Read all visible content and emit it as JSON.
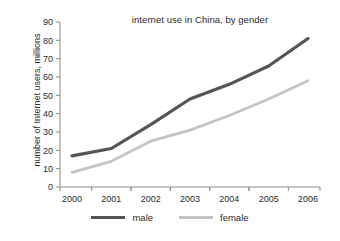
{
  "chart_data": {
    "type": "line",
    "title": "internet use in China, by gender",
    "xlabel": "",
    "ylabel": "number of  Internet users, millions",
    "categories": [
      "2000",
      "2001",
      "2002",
      "2003",
      "2004",
      "2005",
      "2006"
    ],
    "x": [
      2000,
      2001,
      2002,
      2003,
      2004,
      2005,
      2006
    ],
    "series": [
      {
        "name": "male",
        "color": "#555555",
        "values": [
          17,
          21,
          34,
          48,
          56,
          66,
          81
        ]
      },
      {
        "name": "female",
        "color": "#c4c4c4",
        "values": [
          8,
          14,
          25,
          31,
          39,
          48,
          58
        ]
      }
    ],
    "ylim": [
      0,
      90
    ],
    "yticks": [
      0,
      10,
      20,
      30,
      40,
      50,
      60,
      70,
      80,
      90
    ],
    "ytick_labels": [
      "0",
      "10",
      "20",
      "30",
      "40",
      "50",
      "60",
      "70",
      "80",
      "90"
    ],
    "xtick_labels": [
      "2000",
      "2001",
      "2002",
      "2003",
      "2004",
      "2005",
      "2006"
    ],
    "grid": false,
    "legend_position": "bottom",
    "legend_entries": [
      "male",
      "female"
    ],
    "axis_color": "#8a8a8a",
    "text_color": "#2b2b2b",
    "background": "#ffffff"
  }
}
